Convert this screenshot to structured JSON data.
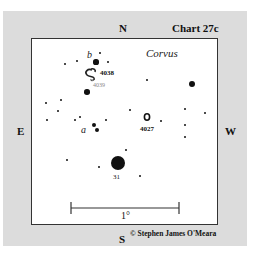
{
  "chart": {
    "title": "Chart 27c",
    "constellation": "Corvus",
    "directions": {
      "north": "N",
      "south": "S",
      "east": "E",
      "west": "W"
    },
    "scale_label": "1°",
    "copyright": "© Stephen James O'Meara"
  },
  "objects": {
    "ngc4038": "4038",
    "ngc4039": "4039",
    "ngc4027": "4027",
    "star31": "31",
    "star_a": "a",
    "star_b": "b"
  },
  "colors": {
    "panel": "#dcdcdc",
    "frame_border": "#333333",
    "star": "#111111"
  },
  "stars": [
    {
      "x": 65,
      "y": 64,
      "r": 1.3
    },
    {
      "x": 77,
      "y": 61,
      "r": 1.3
    },
    {
      "x": 100,
      "y": 53,
      "r": 1.3
    },
    {
      "x": 96,
      "y": 62,
      "r": 2.6
    },
    {
      "x": 108,
      "y": 62,
      "r": 1.3
    },
    {
      "x": 87,
      "y": 92,
      "r": 2.8
    },
    {
      "x": 46,
      "y": 103,
      "r": 1.3
    },
    {
      "x": 61,
      "y": 100,
      "r": 1.3
    },
    {
      "x": 58,
      "y": 111,
      "r": 1.3
    },
    {
      "x": 47,
      "y": 120,
      "r": 1.3
    },
    {
      "x": 75,
      "y": 120,
      "r": 1.3
    },
    {
      "x": 80,
      "y": 117,
      "r": 1.3
    },
    {
      "x": 94,
      "y": 125,
      "r": 2.3
    },
    {
      "x": 97,
      "y": 130,
      "r": 2.3
    },
    {
      "x": 106,
      "y": 120,
      "r": 1.3
    },
    {
      "x": 130,
      "y": 110,
      "r": 1.3
    },
    {
      "x": 161,
      "y": 121,
      "r": 1.3
    },
    {
      "x": 147,
      "y": 80,
      "r": 1.3
    },
    {
      "x": 192,
      "y": 84,
      "r": 3.2
    },
    {
      "x": 185,
      "y": 109,
      "r": 1.3
    },
    {
      "x": 205,
      "y": 113,
      "r": 1.3
    },
    {
      "x": 185,
      "y": 125,
      "r": 1.3
    },
    {
      "x": 185,
      "y": 137,
      "r": 1.3
    },
    {
      "x": 126,
      "y": 150,
      "r": 1.3
    },
    {
      "x": 67,
      "y": 160,
      "r": 1.3
    },
    {
      "x": 99,
      "y": 167,
      "r": 1.3
    },
    {
      "x": 118,
      "y": 163,
      "r": 7
    },
    {
      "x": 140,
      "y": 176,
      "r": 1.3
    }
  ]
}
